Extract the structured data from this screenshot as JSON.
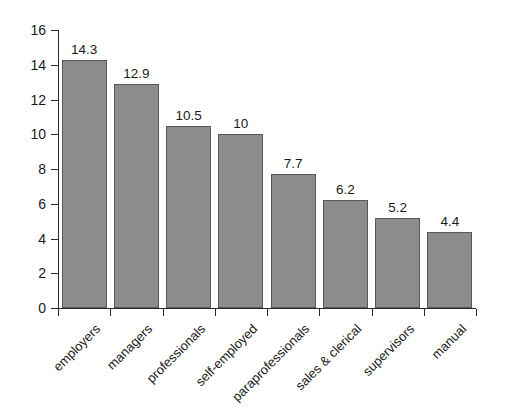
{
  "chart_data": {
    "type": "bar",
    "title": "",
    "subtitle": "",
    "xlabel": "",
    "ylabel": "",
    "categories": [
      "employers",
      "managers",
      "professionals",
      "self-employed",
      "paraprofessionals",
      "sales & clerical",
      "supervisors",
      "manual"
    ],
    "values": [
      14.3,
      12.9,
      10.5,
      10,
      7.7,
      6.2,
      5.2,
      4.4
    ],
    "value_labels": [
      "14.3",
      "12.9",
      "10.5",
      "10",
      "7.7",
      "6.2",
      "5.2",
      "4.4"
    ],
    "ylim": [
      0,
      16
    ],
    "ytick_values": [
      0,
      2,
      4,
      6,
      8,
      10,
      12,
      14,
      16
    ],
    "ytick_labels": [
      "0",
      "2",
      "4",
      "6",
      "8",
      "10",
      "12",
      "14",
      "16"
    ],
    "grid": false,
    "legend": null,
    "legend_position": "none",
    "bar_color": "#8c8c8c",
    "bar_edge_color": "#58585a",
    "axis_color": "#2a2a2a",
    "background_color": "#ffffff",
    "xtick_label_rotation": -45
  }
}
